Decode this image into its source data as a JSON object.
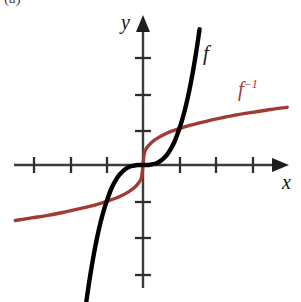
{
  "figure": {
    "corner_mark": "(a)",
    "background_color": "#ffffff"
  },
  "labels": {
    "y_axis": "y",
    "x_axis": "x",
    "function": "f",
    "inverse_base": "f",
    "inverse_exponent": "−1"
  },
  "colors": {
    "axis": "#3c3c3c",
    "function_curve": "#000000",
    "inverse_curve": "#a03a33",
    "text": "#111111"
  },
  "chart_data": {
    "type": "line",
    "title": "",
    "xlabel": "x",
    "ylabel": "y",
    "grid": false,
    "legend_position": "inline-annotations",
    "axis": {
      "origin_px": [
        143,
        165
      ],
      "unit_px": 36.5,
      "xlim": [
        -3.5,
        3.8
      ],
      "ylim": [
        -3.7,
        4.1
      ],
      "x_ticks": [
        -3,
        -2,
        -1,
        1,
        2,
        3
      ],
      "y_ticks": [
        -3,
        -2,
        -1,
        1,
        2,
        3
      ],
      "tick_labels_shown": false,
      "x_ticks_px": [
        34,
        71,
        107,
        180,
        216,
        253
      ],
      "y_ticks_px": [
        58,
        95,
        131,
        202,
        238,
        275
      ],
      "arrowheads": [
        "x-positive",
        "y-positive"
      ]
    },
    "series": [
      {
        "name": "f",
        "label": "f",
        "color": "#000000",
        "description": "cubic function through the origin",
        "equation": "y = x^3",
        "x": [
          -1.55,
          -1.45,
          -1.35,
          -1.25,
          -1.15,
          -1.05,
          -0.95,
          -0.85,
          -0.75,
          -0.65,
          -0.55,
          -0.45,
          -0.35,
          -0.25,
          -0.15,
          0,
          0.15,
          0.25,
          0.35,
          0.45,
          0.55,
          0.65,
          0.75,
          0.85,
          0.95,
          1.05,
          1.15,
          1.25,
          1.35,
          1.45,
          1.55
        ],
        "y": [
          -3.72,
          -3.05,
          -2.46,
          -1.95,
          -1.52,
          -1.16,
          -0.86,
          -0.61,
          -0.42,
          -0.27,
          -0.17,
          -0.09,
          -0.04,
          -0.02,
          0.0,
          0.0,
          0.0,
          0.02,
          0.04,
          0.09,
          0.17,
          0.27,
          0.42,
          0.61,
          0.86,
          1.16,
          1.52,
          1.95,
          2.46,
          3.05,
          3.72
        ]
      },
      {
        "name": "f-inverse",
        "label": "f⁻¹",
        "color": "#a03a33",
        "description": "inverse of the cubic, the cube-root function, reflection of f across the line y = x",
        "equation": "y = x^(1/3)",
        "x": [
          -3.5,
          -3.05,
          -2.6,
          -2.15,
          -1.7,
          -1.3,
          -0.95,
          -0.65,
          -0.42,
          -0.25,
          -0.12,
          -0.04,
          0,
          0.04,
          0.12,
          0.25,
          0.42,
          0.65,
          0.95,
          1.3,
          1.7,
          2.15,
          2.6,
          3.05,
          3.5,
          3.95
        ],
        "y": [
          -1.52,
          -1.45,
          -1.38,
          -1.29,
          -1.19,
          -1.09,
          -0.98,
          -0.87,
          -0.75,
          -0.63,
          -0.49,
          -0.34,
          0.0,
          0.34,
          0.49,
          0.63,
          0.75,
          0.87,
          0.98,
          1.09,
          1.19,
          1.29,
          1.38,
          1.45,
          1.52,
          1.58
        ]
      }
    ],
    "annotations": [
      {
        "text": "f",
        "x_px": 207,
        "y_px": 55,
        "color": "#1a1a1a"
      },
      {
        "text": "f⁻¹",
        "x_px": 248,
        "y_px": 90,
        "color": "#a03a33"
      }
    ]
  }
}
